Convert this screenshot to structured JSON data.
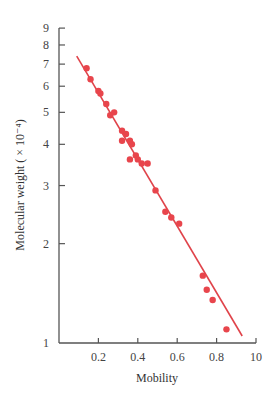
{
  "chart_data": {
    "type": "scatter",
    "title": "",
    "xlabel": "Mobility",
    "ylabel": "Molecular weight ( × 10⁻⁴)",
    "xlim": [
      0,
      1.0
    ],
    "ylim": [
      1,
      10
    ],
    "yscale": "log",
    "grid": false,
    "legend": null,
    "x_ticks": [
      "0.2",
      "0.4",
      "0.6",
      "0.8",
      "10"
    ],
    "x_tick_values": [
      0.2,
      0.4,
      0.6,
      0.8,
      1.0
    ],
    "y_ticks": [
      "1",
      "2",
      "3",
      "4",
      "5",
      "6",
      "7",
      "8",
      "9"
    ],
    "y_tick_values": [
      1,
      2,
      3,
      4,
      5,
      6,
      7,
      8,
      9
    ],
    "colors": {
      "points": "#e8454c",
      "line": "#e0434a",
      "axis": "#555555"
    },
    "series": [
      {
        "name": "data",
        "points": [
          [
            0.14,
            6.8
          ],
          [
            0.16,
            6.3
          ],
          [
            0.2,
            5.8
          ],
          [
            0.21,
            5.7
          ],
          [
            0.24,
            5.3
          ],
          [
            0.26,
            4.9
          ],
          [
            0.28,
            5.0
          ],
          [
            0.32,
            4.4
          ],
          [
            0.34,
            4.3
          ],
          [
            0.32,
            4.1
          ],
          [
            0.36,
            4.1
          ],
          [
            0.37,
            4.0
          ],
          [
            0.36,
            3.6
          ],
          [
            0.39,
            3.7
          ],
          [
            0.4,
            3.6
          ],
          [
            0.42,
            3.5
          ],
          [
            0.45,
            3.5
          ],
          [
            0.49,
            2.9
          ],
          [
            0.54,
            2.5
          ],
          [
            0.57,
            2.4
          ],
          [
            0.61,
            2.3
          ],
          [
            0.73,
            1.6
          ],
          [
            0.75,
            1.45
          ],
          [
            0.78,
            1.35
          ],
          [
            0.85,
            1.1
          ]
        ]
      },
      {
        "name": "fit",
        "type": "line",
        "points": [
          [
            0.09,
            7.4
          ],
          [
            0.93,
            1.05
          ]
        ]
      }
    ]
  }
}
